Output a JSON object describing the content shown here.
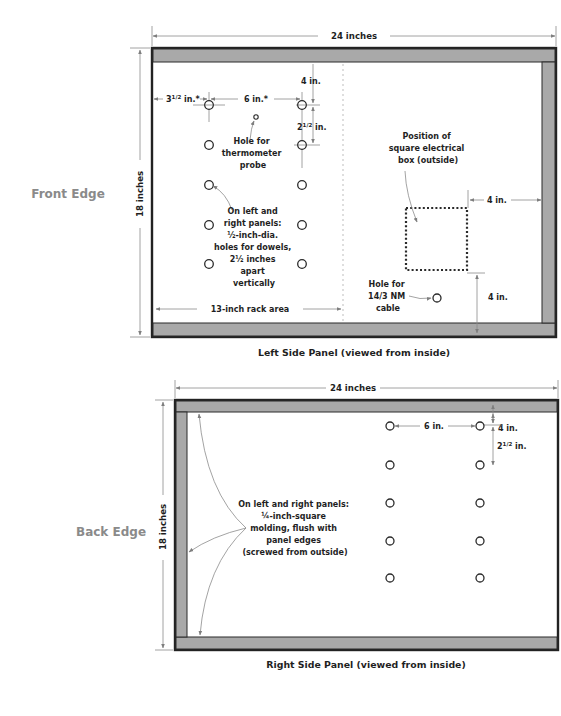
{
  "colors": {
    "frame": "#222222",
    "rail_fill": "#a9a9a9",
    "dimension_line": "#8c8c8c",
    "edge_label": "#8a8a8a",
    "text": "#1f1f1f"
  },
  "left_panel": {
    "caption": "Left Side Panel (viewed from inside)",
    "edge_label": "Front Edge",
    "width_dim": "24 inches",
    "height_dim": "18 inches",
    "dim_3_5": "3½ in.*",
    "dim_3_5_parts": {
      "whole": "3",
      "frac": "1/2",
      "unit": " in.*"
    },
    "dim_6": "6 in.*",
    "dim_4_top": "4 in.",
    "dim_2_5": "2½ in.",
    "dim_2_5_parts": {
      "whole": "2",
      "frac": "1/2",
      "unit": " in."
    },
    "thermo_note": [
      "Hole for",
      "thermometer",
      "probe"
    ],
    "dowel_note": [
      "On left and",
      "right panels:",
      "½-inch-dia.",
      "holes for dowels,",
      "2½ inches",
      "apart",
      "vertically"
    ],
    "rack_area": "13-inch rack area",
    "box_note": [
      "Position of",
      "square electrical",
      "box (outside)"
    ],
    "box_right_dim": "4 in.",
    "box_bottom_dim": "4 in.",
    "cable_note": [
      "Hole for",
      "14/3 NM",
      "cable"
    ]
  },
  "right_panel": {
    "caption": "Right Side Panel (viewed from inside)",
    "edge_label": "Back Edge",
    "width_dim": "24 inches",
    "height_dim": "18 inches",
    "dim_4_top": "4 in.",
    "dim_6": "6 in.",
    "dim_2_5": "2½ in.",
    "dim_2_5_parts": {
      "whole": "2",
      "frac": "1/2",
      "unit": " in."
    },
    "molding_note": [
      "On left and right panels:",
      "¼-inch-square",
      "molding, flush with",
      "panel edges",
      "(screwed from outside)"
    ]
  }
}
